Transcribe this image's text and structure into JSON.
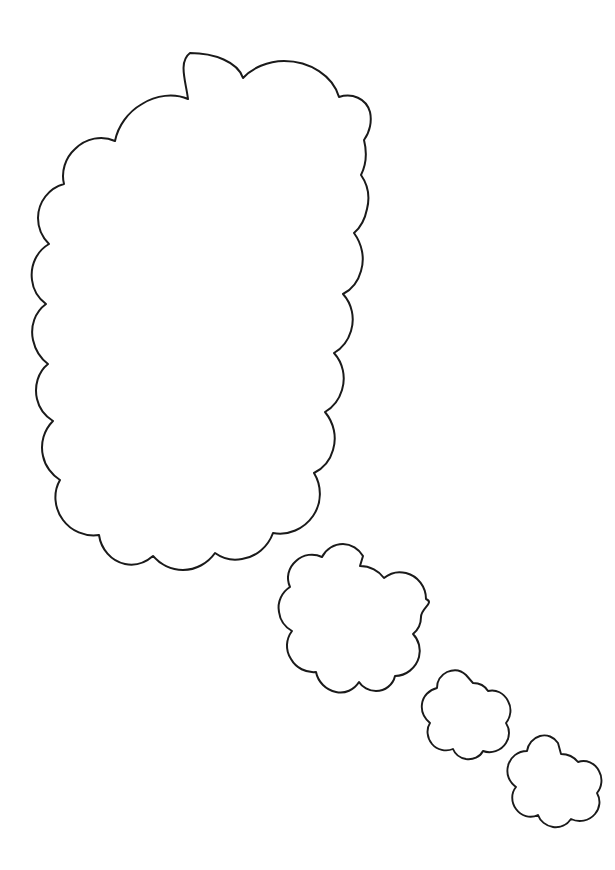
{
  "document": {
    "title": "Thought Bubble Coloring Page",
    "background_color": "#ffffff",
    "outline_color": "#1a1a1a",
    "fill_color": "#ffffff",
    "width": 615,
    "height": 870,
    "style": "line-art coloring page",
    "subject": "thought bubble / speech cloud with trailing puffs"
  },
  "artwork": {
    "shape_count": 4,
    "arrangement": "large cloud upper-left with three diminishing puffs trailing toward lower-right",
    "shapes": [
      {
        "id": "main-thought-cloud",
        "label": "Large thought bubble",
        "order": 1,
        "size": "large",
        "bbox": {
          "x": 32,
          "y": 52,
          "width": 338,
          "height": 518
        },
        "center": {
          "x": 201,
          "y": 311
        },
        "scallops": 16,
        "stroke_width": 2
      },
      {
        "id": "puff-cloud-1",
        "label": "Medium trailing puff",
        "order": 2,
        "size": "medium",
        "bbox": {
          "x": 299,
          "y": 566,
          "width": 122,
          "height": 125
        },
        "center": {
          "x": 360,
          "y": 628
        },
        "scallops": 9,
        "stroke_width": 2
      },
      {
        "id": "puff-cloud-2",
        "label": "Small trailing puff",
        "order": 3,
        "size": "small",
        "bbox": {
          "x": 443,
          "y": 683,
          "width": 60,
          "height": 63
        },
        "center": {
          "x": 473,
          "y": 714
        },
        "scallops": 7,
        "stroke_width": 2
      },
      {
        "id": "puff-cloud-3",
        "label": "Smallest trailing puff",
        "order": 4,
        "size": "small",
        "bbox": {
          "x": 530,
          "y": 754,
          "width": 67,
          "height": 62
        },
        "center": {
          "x": 563,
          "y": 785
        },
        "scallops": 7,
        "stroke_width": 2
      }
    ]
  },
  "caption": {
    "text": ""
  }
}
